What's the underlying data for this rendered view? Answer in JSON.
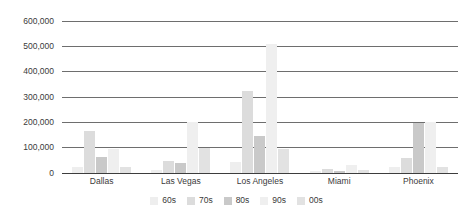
{
  "chart_data": {
    "type": "bar",
    "title": "",
    "subtitle": "",
    "xlabel": "",
    "ylabel": "",
    "ylim": [
      0,
      600000
    ],
    "y_ticks": [
      "0",
      "100,000",
      "200,000",
      "300,000",
      "400,000",
      "500,000",
      "600,000"
    ],
    "y_tick_values": [
      0,
      100000,
      200000,
      300000,
      400000,
      500000,
      600000
    ],
    "grid": true,
    "legend_position": "bottom",
    "categories": [
      "Dallas",
      "Las Vegas",
      "Los Angeles",
      "Miami",
      "Phoenix"
    ],
    "series": [
      {
        "name": "60s",
        "color": "#eeeeee",
        "values": [
          22000,
          12000,
          42000,
          7000,
          25000
        ]
      },
      {
        "name": "70s",
        "color": "#dcdcdc",
        "values": [
          165000,
          48000,
          325000,
          14000,
          60000
        ]
      },
      {
        "name": "80s",
        "color": "#c9c9c9",
        "values": [
          63000,
          38000,
          145000,
          9000,
          196000
        ]
      },
      {
        "name": "90s",
        "color": "#efefef",
        "values": [
          96000,
          200000,
          510000,
          31000,
          200000
        ]
      },
      {
        "name": "00s",
        "color": "#e2e2e2",
        "values": [
          22000,
          100000,
          93000,
          11000,
          25000
        ]
      }
    ]
  },
  "legend": {
    "items": [
      {
        "label": "60s"
      },
      {
        "label": "70s"
      },
      {
        "label": "80s"
      },
      {
        "label": "90s"
      },
      {
        "label": "00s"
      }
    ]
  }
}
